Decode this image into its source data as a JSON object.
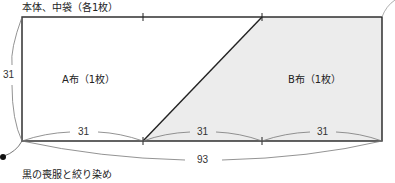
{
  "diagram": {
    "title": "本体、中袋（各1枚）",
    "caption": "黒の喪服と絞り染め",
    "pieces": [
      {
        "label": "A布（1枚）",
        "fill": "#ffffff"
      },
      {
        "label": "B布（1枚）",
        "fill": "#ececec"
      }
    ],
    "dimensions": {
      "height": "31",
      "segment_1": "31",
      "segment_2": "31",
      "segment_3": "31",
      "total_width": "93"
    },
    "colors": {
      "line": "#222222",
      "shade": "#ececec",
      "annotation": "#666666"
    }
  }
}
